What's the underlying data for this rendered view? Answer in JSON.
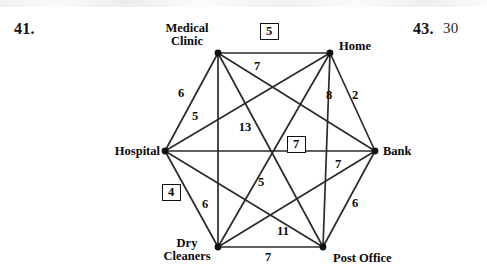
{
  "exercise": {
    "left_number": "41.",
    "right_number": "43.",
    "right_answer": "30"
  },
  "graph": {
    "type": "weighted-complete-graph-K6",
    "vertices": [
      {
        "id": "medical_clinic",
        "label": "Medical\nClinic",
        "x": 218,
        "y": 53
      },
      {
        "id": "home",
        "label": "Home",
        "x": 330,
        "y": 53
      },
      {
        "id": "bank",
        "label": "Bank",
        "x": 375,
        "y": 151
      },
      {
        "id": "post_office",
        "label": "Post Office",
        "x": 323,
        "y": 247
      },
      {
        "id": "dry_cleaners",
        "label": "Dry\nCleaners",
        "x": 218,
        "y": 247
      },
      {
        "id": "hospital",
        "label": "Hospital",
        "x": 165,
        "y": 151
      }
    ],
    "vertex_labels": {
      "medical_clinic": "Medical Clinic",
      "medical_clinic_line1": "Medical",
      "medical_clinic_line2": "Clinic",
      "home": "Home",
      "bank": "Bank",
      "post_office": "Post Office",
      "dry_cleaners_line1": "Dry",
      "dry_cleaners_line2": "Cleaners",
      "hospital": "Hospital"
    },
    "edges": [
      {
        "from": "medical_clinic",
        "to": "home",
        "weight": "5",
        "boxed": true,
        "lx": 268,
        "ly": 31
      },
      {
        "from": "home",
        "to": "bank",
        "weight": "2",
        "boxed": false,
        "lx": 355,
        "ly": 96
      },
      {
        "from": "bank",
        "to": "post_office",
        "weight": "6",
        "boxed": false,
        "lx": 355,
        "ly": 204
      },
      {
        "from": "post_office",
        "to": "dry_cleaners",
        "weight": "7",
        "boxed": false,
        "lx": 268,
        "ly": 258
      },
      {
        "from": "dry_cleaners",
        "to": "hospital",
        "weight": "4",
        "boxed": true,
        "lx": 170,
        "ly": 192
      },
      {
        "from": "hospital",
        "to": "medical_clinic",
        "weight": "6",
        "boxed": false,
        "lx": 181,
        "ly": 94
      },
      {
        "from": "medical_clinic",
        "to": "bank",
        "weight": "7",
        "boxed": false,
        "lx": 257,
        "ly": 67
      },
      {
        "from": "medical_clinic",
        "to": "post_office",
        "weight": "13",
        "boxed": false,
        "lx": 245,
        "ly": 128
      },
      {
        "from": "medical_clinic",
        "to": "dry_cleaners",
        "weight": "6",
        "boxed": false,
        "lx": 205,
        "ly": 205
      },
      {
        "from": "home",
        "to": "hospital",
        "weight": "5",
        "boxed": false,
        "lx": 195,
        "ly": 117
      },
      {
        "from": "home",
        "to": "post_office",
        "weight": "8",
        "boxed": false,
        "lx": 329,
        "ly": 96
      },
      {
        "from": "home",
        "to": "dry_cleaners",
        "weight": "5",
        "boxed": false,
        "lx": 261,
        "ly": 183
      },
      {
        "from": "hospital",
        "to": "bank",
        "weight": "7",
        "boxed": true,
        "lx": 295,
        "ly": 144
      },
      {
        "from": "dry_cleaners",
        "to": "bank",
        "weight": "11",
        "boxed": false,
        "lx": 283,
        "ly": 232
      },
      {
        "from": "post_office",
        "to": "hospital",
        "weight": "7",
        "boxed": false,
        "lx": 338,
        "ly": 165
      }
    ],
    "style": {
      "line_color": "#2b2b2b",
      "vertex_color": "#111111",
      "text_color": "#0a0a0a",
      "background": "#ffffff"
    }
  }
}
